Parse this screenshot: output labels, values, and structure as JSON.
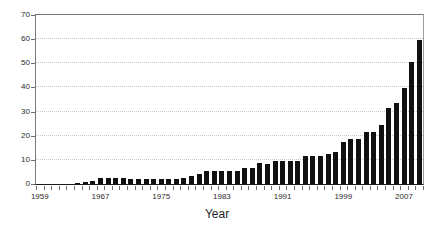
{
  "chart_data": {
    "type": "bar",
    "title": "",
    "xlabel": "Year",
    "ylabel": "",
    "ylim": [
      0,
      70
    ],
    "ytick_labels": [
      "0",
      "10",
      "20",
      "30",
      "40",
      "50",
      "60",
      "70"
    ],
    "ytick_values": [
      0,
      10,
      20,
      30,
      40,
      50,
      60,
      70
    ],
    "xtick_labels": [
      "1959",
      "1967",
      "1975",
      "1983",
      "1991",
      "1999",
      "2007"
    ],
    "xtick_values": [
      1959,
      1967,
      1975,
      1983,
      1991,
      1999,
      2007
    ],
    "grid": "horizontal-dotted",
    "legend": "none",
    "bar_color": "#111111",
    "categories": [
      1959,
      1960,
      1961,
      1962,
      1963,
      1964,
      1965,
      1966,
      1967,
      1968,
      1969,
      1970,
      1971,
      1972,
      1973,
      1974,
      1975,
      1976,
      1977,
      1978,
      1979,
      1980,
      1981,
      1982,
      1983,
      1984,
      1985,
      1986,
      1987,
      1988,
      1989,
      1990,
      1991,
      1992,
      1993,
      1994,
      1995,
      1996,
      1997,
      1998,
      1999,
      2000,
      2001,
      2002,
      2003,
      2004,
      2005,
      2006,
      2007,
      2008,
      2009
    ],
    "values": [
      0,
      0,
      0,
      0,
      0,
      0.6,
      0.7,
      1.4,
      2.3,
      2.3,
      2.3,
      2.3,
      2.2,
      2.2,
      2.2,
      2.2,
      2.2,
      2.2,
      2.2,
      2.4,
      3.3,
      4.2,
      5.5,
      5.4,
      5.5,
      5.3,
      5.4,
      6.6,
      6.7,
      8.6,
      8.3,
      9.5,
      9.6,
      9.5,
      9.4,
      11.7,
      11.5,
      11.6,
      12.5,
      13.2,
      17.6,
      18.6,
      18.6,
      21.5,
      21.5,
      24.4,
      31.5,
      33.6,
      39.6,
      50.4,
      59.6
    ]
  },
  "axis": {
    "x_title": "Year"
  }
}
